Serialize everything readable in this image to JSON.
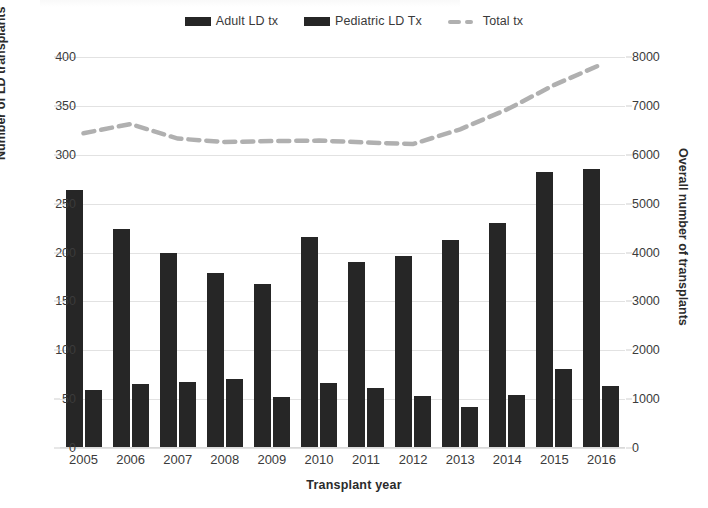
{
  "chart_data": {
    "type": "bar",
    "title": "",
    "xlabel": "Transplant year",
    "ylabel": "Number of LD transplants",
    "y2label": "Overall number of transplants",
    "categories": [
      "2005",
      "2006",
      "2007",
      "2008",
      "2009",
      "2010",
      "2011",
      "2012",
      "2013",
      "2014",
      "2015",
      "2016"
    ],
    "ylim": [
      0,
      400
    ],
    "y2lim": [
      0,
      8000
    ],
    "yticks": [
      "400",
      "350",
      "300",
      "250",
      "200",
      "150",
      "100",
      "50",
      "0"
    ],
    "ytick_values": [
      400,
      350,
      300,
      250,
      200,
      150,
      100,
      50,
      0
    ],
    "y2ticks": [
      "8000",
      "7000",
      "6000",
      "5000",
      "4000",
      "3000",
      "2000",
      "1000",
      "0"
    ],
    "y2tick_values": [
      8000,
      7000,
      6000,
      5000,
      4000,
      3000,
      2000,
      1000,
      0
    ],
    "grid": true,
    "legend_position": "top-center",
    "series": [
      {
        "name": "Adult LD tx",
        "kind": "bar",
        "axis": "left",
        "color": "#262626",
        "values": [
          264,
          224,
          199,
          179,
          168,
          216,
          190,
          196,
          213,
          230,
          282,
          285
        ]
      },
      {
        "name": "Pediatric LD Tx",
        "kind": "bar",
        "axis": "left",
        "color": "#262626",
        "values": [
          59,
          65,
          68,
          71,
          52,
          67,
          61,
          53,
          42,
          54,
          81,
          63
        ]
      },
      {
        "name": "Total tx",
        "kind": "line-dashed",
        "axis": "right",
        "color": "#b0b0b0",
        "values": [
          6440,
          6630,
          6330,
          6260,
          6280,
          6290,
          6250,
          6220,
          6520,
          6930,
          7430,
          7850
        ]
      }
    ]
  },
  "legend": {
    "items": [
      {
        "label": "Adult LD tx",
        "marker": "bar-swatch"
      },
      {
        "label": "Pediatric LD Tx",
        "marker": "bar-swatch"
      },
      {
        "label": "Total tx",
        "marker": "dashed-line-swatch"
      }
    ]
  },
  "colors": {
    "bar": "#262626",
    "line": "#b0b0b0",
    "grid": "#e2e2e2",
    "text": "#2b2b2b",
    "background": "#ffffff"
  }
}
